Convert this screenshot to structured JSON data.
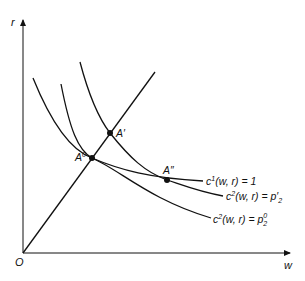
{
  "diagram": {
    "axes": {
      "y_label": "r",
      "x_label": "w",
      "origin_label": "O"
    },
    "points": [
      {
        "id": "A0",
        "label": "A",
        "sup": "0"
      },
      {
        "id": "Aprime",
        "label": "A′",
        "sup": ""
      },
      {
        "id": "Adoubleprime",
        "label": "A″",
        "sup": ""
      }
    ],
    "curves": [
      {
        "id": "c1",
        "base": "c",
        "sup": "1",
        "args": "(w, r) = ",
        "rhs": "1",
        "rhs_sub": ""
      },
      {
        "id": "c2_prime",
        "base": "c",
        "sup": "2",
        "args": "(w, r) = ",
        "rhs": "p′",
        "rhs_sub": "2"
      },
      {
        "id": "c2_zero",
        "base": "c",
        "sup": "2",
        "args": "(w, r) = ",
        "rhs": "p",
        "rhs_sub": "2",
        "rhs_sup": "0"
      }
    ],
    "ray": {
      "from": "O",
      "through": [
        "A0",
        "Aprime"
      ]
    }
  }
}
